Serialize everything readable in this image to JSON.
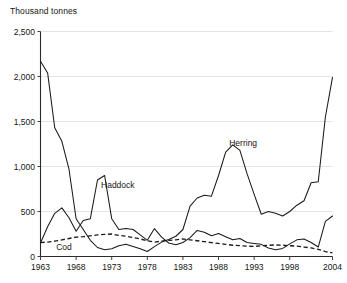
{
  "chart_data": {
    "type": "line",
    "title": "Thousand tonnes",
    "ylabel": "Thousand tonnes",
    "xlabel": "",
    "ylim": [
      0,
      2500
    ],
    "xlim": [
      1963,
      2004
    ],
    "grid": true,
    "legend_position": "inline-annotations",
    "ytick_labels": [
      "0",
      "500",
      "1,000",
      "1,500",
      "2,000",
      "2,500"
    ],
    "ytick_values": [
      0,
      500,
      1000,
      1500,
      2000,
      2500
    ],
    "xtick_labels": [
      "1963",
      "1968",
      "1973",
      "1978",
      "1983",
      "1988",
      "1993",
      "1998",
      "2004"
    ],
    "xtick_values": [
      1963,
      1968,
      1973,
      1978,
      1983,
      1988,
      1993,
      1998,
      2004
    ],
    "x": [
      1963,
      1964,
      1965,
      1966,
      1967,
      1968,
      1969,
      1970,
      1971,
      1972,
      1973,
      1974,
      1975,
      1976,
      1977,
      1978,
      1979,
      1980,
      1981,
      1982,
      1983,
      1984,
      1985,
      1986,
      1987,
      1988,
      1989,
      1990,
      1991,
      1992,
      1993,
      1994,
      1995,
      1996,
      1997,
      1998,
      1999,
      2000,
      2001,
      2002,
      2003,
      2004
    ],
    "series": [
      {
        "name": "Herring",
        "style": "solid",
        "label_x": 1989.5,
        "label_y": 1230,
        "values": [
          2170,
          2040,
          1430,
          1280,
          970,
          420,
          300,
          180,
          100,
          75,
          85,
          120,
          135,
          110,
          85,
          55,
          110,
          160,
          190,
          225,
          300,
          560,
          650,
          680,
          670,
          900,
          1160,
          1240,
          1180,
          920,
          690,
          470,
          500,
          480,
          450,
          500,
          570,
          620,
          820,
          830,
          1550,
          1990
        ]
      },
      {
        "name": "Haddock",
        "style": "solid",
        "label_x": 1971.5,
        "label_y": 760,
        "values": [
          150,
          330,
          480,
          540,
          430,
          280,
          400,
          420,
          850,
          900,
          420,
          300,
          310,
          300,
          240,
          180,
          310,
          215,
          150,
          130,
          155,
          210,
          290,
          270,
          230,
          255,
          220,
          185,
          200,
          155,
          145,
          135,
          95,
          75,
          90,
          140,
          185,
          195,
          155,
          105,
          390,
          450
        ]
      },
      {
        "name": "Cod",
        "style": "dashed",
        "label_x": 1965.2,
        "label_y": 75,
        "values": [
          155,
          160,
          170,
          185,
          200,
          215,
          220,
          230,
          240,
          245,
          250,
          235,
          225,
          210,
          195,
          175,
          160,
          170,
          180,
          185,
          195,
          185,
          175,
          165,
          155,
          145,
          135,
          125,
          120,
          115,
          112,
          120,
          125,
          128,
          125,
          120,
          115,
          105,
          95,
          80,
          55,
          40
        ]
      }
    ]
  },
  "labels": {
    "axis_title": "Thousand tonnes",
    "herring": "Herring",
    "haddock": "Haddock",
    "cod": "Cod"
  }
}
